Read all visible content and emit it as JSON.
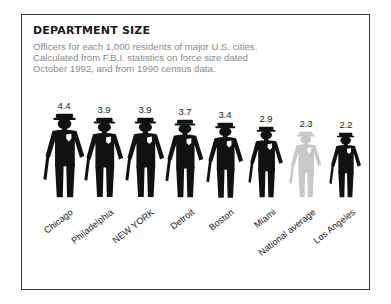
{
  "title": "DEPARTMENT SIZE",
  "subtitle_lines": [
    "Officers for each 1,000 residents of major U.S. cities.",
    "Calculated from F.B.I. statistics on force size dated",
    "October 1992, and  from 1990 census data."
  ],
  "colors": {
    "figure": "#111111",
    "figure_average": "#c8c8c8",
    "badge": "#ffffff",
    "border": "#3a3a3a"
  },
  "chart_data": {
    "type": "bar",
    "style": "pictograph",
    "title": "DEPARTMENT SIZE",
    "subtitle": "Officers for each 1,000 residents of major U.S. cities. Calculated from F.B.I. statistics on force size dated October 1992, and  from 1990 census data.",
    "xlabel": "",
    "ylabel": "Officers per 1,000 residents",
    "categories": [
      "Chicago",
      "Philadelphia",
      "NEW YORK",
      "Detroit",
      "Boston",
      "Miami",
      "National average",
      "Los Angeles"
    ],
    "values": [
      4.4,
      3.9,
      3.9,
      3.7,
      3.4,
      2.9,
      2.3,
      2.2
    ],
    "value_labels": [
      "4.4",
      "3.9",
      "3.9",
      "3.7",
      "3.4",
      "2.9",
      "2.3",
      "2.2"
    ],
    "highlight": {
      "National average": "gray"
    },
    "grid": false,
    "legend": null
  }
}
